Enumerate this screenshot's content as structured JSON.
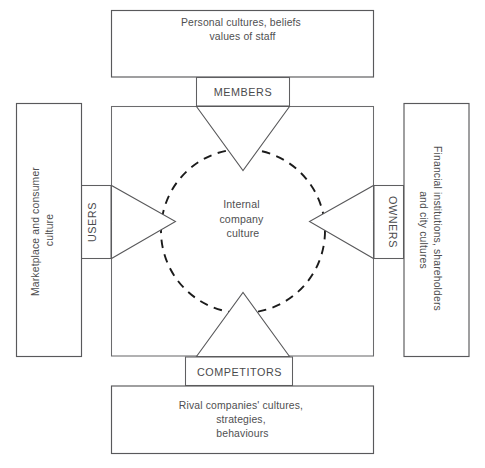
{
  "diagram": {
    "type": "stakeholder-culture-diagram",
    "center": {
      "name": "internal-company-culture",
      "lines": [
        "Internal",
        "company",
        "culture"
      ],
      "text": "Internal company culture"
    },
    "outer_boxes": [
      {
        "id": "top",
        "name": "personal-cultures-box",
        "lines": [
          "Personal cultures, beliefs",
          "values of staff"
        ],
        "text": "Personal cultures, beliefs values of staff",
        "orientation": "horizontal"
      },
      {
        "id": "left",
        "name": "marketplace-consumer-culture-box",
        "lines": [
          "Marketplace and consumer",
          "culture"
        ],
        "text": "Marketplace and consumer culture",
        "orientation": "vertical-up"
      },
      {
        "id": "right",
        "name": "financial-institutions-box",
        "lines": [
          "Financial institutions, shareholders",
          "and city cultures"
        ],
        "text": "Financial institutions, shareholders and city cultures",
        "orientation": "vertical-down"
      },
      {
        "id": "bottom",
        "name": "rival-companies-box",
        "lines": [
          "Rival companies' cultures,",
          "strategies,",
          "behaviours"
        ],
        "text": "Rival companies' cultures, strategies, behaviours",
        "orientation": "horizontal"
      }
    ],
    "connector_labels": [
      {
        "id": "members",
        "name": "members-label",
        "text": "MEMBERS",
        "orientation": "horizontal"
      },
      {
        "id": "users",
        "name": "users-label",
        "text": "USERS",
        "orientation": "vertical-up"
      },
      {
        "id": "owners",
        "name": "owners-label",
        "text": "OWNERS",
        "orientation": "vertical-down"
      },
      {
        "id": "competitors",
        "name": "competitors-label",
        "text": "COMPETITORS",
        "orientation": "horizontal"
      }
    ],
    "colors": {
      "background": "#ffffff",
      "box_stroke": "#59595b",
      "text": "#4f4f51",
      "dashed_circle": "#1b1b1b",
      "arrow_stroke": "#58585a"
    }
  }
}
